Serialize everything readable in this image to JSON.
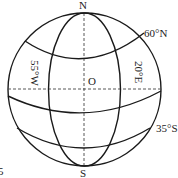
{
  "diagram": {
    "type": "globe-latitude-longitude",
    "labels": {
      "north": "N",
      "south": "S",
      "center": "O",
      "lat_north": "60°N",
      "lat_south": "35°S",
      "lon_west": "55°W",
      "lon_east": "20°E",
      "question_number": "5"
    },
    "colors": {
      "line": "#1a1a1a",
      "dashed": "#444444",
      "text": "#222222"
    }
  }
}
